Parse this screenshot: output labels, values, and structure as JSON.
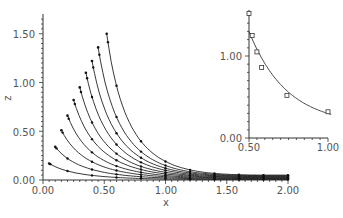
{
  "chart_data": [
    {
      "type": "line",
      "title": "",
      "xlabel": "x",
      "ylabel": "z",
      "xlim": [
        0.0,
        2.0
      ],
      "ylim": [
        0.0,
        1.65
      ],
      "grid": false,
      "legend": "none",
      "x_ticks": [
        "0.00",
        "0.50",
        "1.00",
        "1.50",
        "2.00"
      ],
      "y_ticks": [
        "0.00",
        "0.50",
        "1.00",
        "1.50"
      ],
      "series": [
        {
          "name": "curve-1",
          "start": [
            0.05,
            0.17
          ],
          "end": [
            2.0,
            0.005
          ]
        },
        {
          "name": "curve-2",
          "start": [
            0.1,
            0.34
          ],
          "end": [
            2.0,
            0.01
          ]
        },
        {
          "name": "curve-3",
          "start": [
            0.15,
            0.51
          ],
          "end": [
            2.0,
            0.015
          ]
        },
        {
          "name": "curve-4",
          "start": [
            0.2,
            0.66
          ],
          "end": [
            2.0,
            0.02
          ]
        },
        {
          "name": "curve-5",
          "start": [
            0.25,
            0.82
          ],
          "end": [
            2.0,
            0.025
          ]
        },
        {
          "name": "curve-6",
          "start": [
            0.3,
            0.95
          ],
          "end": [
            2.0,
            0.03
          ]
        },
        {
          "name": "curve-7",
          "start": [
            0.35,
            1.1
          ],
          "end": [
            2.0,
            0.035
          ]
        },
        {
          "name": "curve-8",
          "start": [
            0.4,
            1.22
          ],
          "end": [
            2.0,
            0.04
          ]
        },
        {
          "name": "curve-9",
          "start": [
            0.45,
            1.36
          ],
          "end": [
            2.0,
            0.045
          ]
        },
        {
          "name": "curve-10",
          "start": [
            0.52,
            1.5
          ],
          "end": [
            2.0,
            0.05
          ]
        }
      ],
      "marker_x": [
        0.2,
        0.4,
        0.6,
        0.8,
        1.0,
        1.2,
        1.4,
        1.6,
        1.8,
        2.0
      ]
    },
    {
      "type": "line",
      "title": "",
      "xlabel": "",
      "ylabel": "",
      "xlim": [
        0.5,
        1.0
      ],
      "ylim": [
        0.0,
        1.55
      ],
      "x_ticks": [
        "0.50",
        "1.00"
      ],
      "y_ticks": [
        "0.00",
        "1.00"
      ],
      "series": [
        {
          "name": "peak-locus",
          "x": [
            0.5,
            0.52,
            0.55,
            0.58,
            0.74,
            1.0
          ],
          "y": [
            1.52,
            1.25,
            1.05,
            0.86,
            0.52,
            0.32
          ],
          "marker": "square"
        }
      ]
    }
  ],
  "labels": {
    "main_xlabel": "x",
    "main_ylabel": "z",
    "main_x_ticks": [
      "0.00",
      "0.50",
      "1.00",
      "1.50",
      "2.00"
    ],
    "main_y_ticks": [
      "0.00",
      "0.50",
      "1.00",
      "1.50"
    ],
    "inset_x_ticks": [
      "0.50",
      "1.00"
    ],
    "inset_y_ticks": [
      "0.00",
      "1.00"
    ]
  }
}
